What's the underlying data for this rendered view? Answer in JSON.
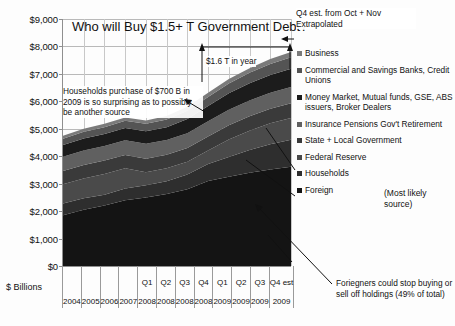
{
  "chart_data": {
    "type": "area",
    "title": "Who will Buy $1.5+ T Government Debt?",
    "xlabel": "",
    "ylabel": "$ Billions",
    "ylim": [
      0,
      9000
    ],
    "ytick_labels": [
      "$9,000",
      "$8,000",
      "$7,000",
      "$6,000",
      "$5,000",
      "$4,000",
      "$3,000",
      "$2,000",
      "$1,000",
      "$0"
    ],
    "ytick_values": [
      9000,
      8000,
      7000,
      6000,
      5000,
      4000,
      3000,
      2000,
      1000,
      0
    ],
    "grid": true,
    "legend_position": "right",
    "stacked": true,
    "categories": [
      "2004",
      "2005",
      "2006",
      "2007",
      "Q1 2008",
      "Q2 2008",
      "Q3 2008",
      "Q4 2008",
      "Q1 2009",
      "Q2 2009",
      "Q3 2009",
      "Q4 est 2009"
    ],
    "category_quarters": [
      "",
      "",
      "",
      "",
      "Q1",
      "Q2",
      "Q3",
      "Q4",
      "Q1",
      "Q2",
      "Q3",
      "Q4 est"
    ],
    "category_years": [
      "2004",
      "2005",
      "2006",
      "2007",
      "2008",
      "2008",
      "2008",
      "2008",
      "2009",
      "2009",
      "2009",
      "2009"
    ],
    "series": [
      {
        "name": "Foreign",
        "color": "#141414",
        "values": [
          1850,
          2050,
          2200,
          2400,
          2500,
          2620,
          2800,
          3100,
          3250,
          3400,
          3520,
          3620
        ]
      },
      {
        "name": "Households",
        "color": "#2e2e2e",
        "values": [
          430,
          420,
          400,
          420,
          440,
          470,
          530,
          620,
          720,
          830,
          920,
          980
        ]
      },
      {
        "name": "Federal Reserve",
        "color": "#4a4a4a",
        "values": [
          700,
          720,
          750,
          740,
          480,
          470,
          470,
          490,
          640,
          700,
          760,
          790
        ]
      },
      {
        "name": "State + Local Government",
        "color": "#3a3a3a",
        "values": [
          480,
          490,
          490,
          480,
          490,
          490,
          500,
          510,
          520,
          530,
          530,
          540
        ]
      },
      {
        "name": "Insurance Pensions Gov't Retirement",
        "color": "#606060",
        "values": [
          520,
          530,
          530,
          540,
          540,
          540,
          540,
          550,
          560,
          570,
          580,
          590
        ]
      },
      {
        "name": "Money Market, Mutual funds, GSE, ABS issuers, Broker Dealers",
        "color": "#1c1c1c",
        "values": [
          430,
          440,
          440,
          450,
          460,
          470,
          520,
          560,
          600,
          630,
          650,
          670
        ]
      },
      {
        "name": "Commercial and Savings Banks, Credit Unions",
        "color": "#545454",
        "values": [
          230,
          240,
          250,
          260,
          270,
          280,
          300,
          330,
          360,
          380,
          400,
          420
        ]
      },
      {
        "name": "Business",
        "color": "#7a7a7a",
        "values": [
          110,
          110,
          120,
          120,
          120,
          130,
          140,
          150,
          160,
          170,
          180,
          190
        ]
      }
    ],
    "legend_entries": [
      {
        "label": "Business",
        "color": "#7a7a7a"
      },
      {
        "label": "Commercial and Savings Banks, Credit Unions",
        "color": "#545454"
      },
      {
        "label": "Money Market, Mutual funds, GSE, ABS issuers, Broker Dealers",
        "color": "#1c1c1c"
      },
      {
        "label": "Insurance Pensions Gov't Retirement",
        "color": "#606060"
      },
      {
        "label": "State + Local Government",
        "color": "#3a3a3a"
      },
      {
        "label": "Federal Reserve",
        "color": "#4a4a4a"
      },
      {
        "label": "Households",
        "color": "#2e2e2e"
      },
      {
        "label": "Foreign",
        "color": "#141414"
      }
    ],
    "annotations": [
      {
        "id": "q4-est",
        "text": "Q4 est. from Oct + Nov Extrapolated"
      },
      {
        "id": "one-six-t",
        "text": "$1.6 T in year"
      },
      {
        "id": "households-note",
        "text": "Households purchase of $700 B in 2009 is so surprising as to possibly be another source"
      },
      {
        "id": "most-likely",
        "text": "(Most likely source)"
      },
      {
        "id": "foreign-note",
        "text": "Foriegners could stop buying or sell off holdings (49% of total)"
      }
    ]
  }
}
